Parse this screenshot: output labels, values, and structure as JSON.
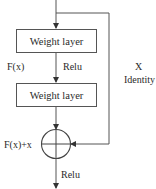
{
  "diagram": {
    "type": "residual-block",
    "blocks": [
      {
        "label": "Weight layer"
      },
      {
        "label": "Weight layer"
      }
    ],
    "labels": {
      "fx": "F(x)",
      "relu_mid": "Relu",
      "x": "X",
      "identity": "Identity",
      "sum": "F(x)+x",
      "relu_out": "Relu"
    },
    "colors": {
      "line": "#555555",
      "text": "#2a2a2a",
      "background": "#ffffff"
    }
  }
}
